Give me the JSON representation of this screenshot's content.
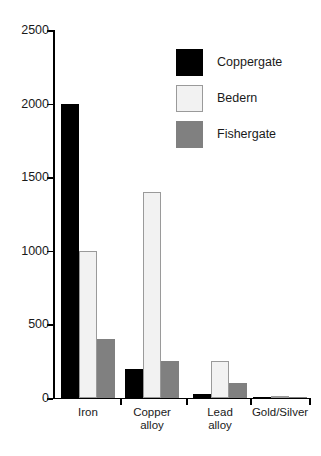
{
  "chart_data": {
    "type": "bar",
    "title": "",
    "subtitle": "",
    "xlabel": "",
    "ylabel": "",
    "ylim": [
      0,
      2500
    ],
    "yticks": [
      0,
      500,
      1000,
      1500,
      2000,
      2500
    ],
    "ytick_labels": [
      "0",
      "500",
      "1000",
      "1500",
      "2000",
      "2500"
    ],
    "grid": false,
    "legend_position": "top-right",
    "categories": [
      "Iron",
      "Copper\nalloy",
      "Lead\nalloy",
      "Gold/Silver"
    ],
    "series": [
      {
        "name": "Coppergate",
        "color": "#000000",
        "values": [
          2000,
          200,
          30,
          5
        ]
      },
      {
        "name": "Bedern",
        "color": "#f2f2f2",
        "values": [
          1000,
          1400,
          250,
          5
        ]
      },
      {
        "name": "Fishergate",
        "color": "#808080",
        "values": [
          400,
          250,
          100,
          5
        ]
      }
    ]
  }
}
